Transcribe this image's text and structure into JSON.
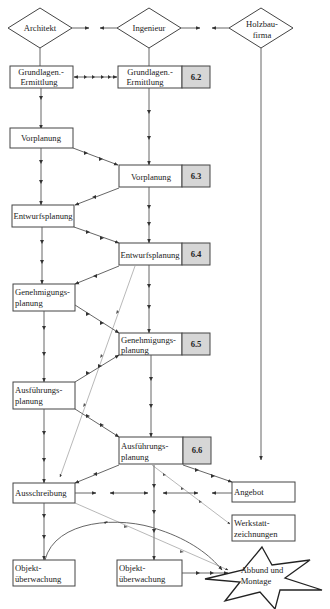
{
  "actors": {
    "architekt": "Architekt",
    "ingenieur": "Ingenieur",
    "holzbaufirma_line1": "Holzbau-",
    "holzbaufirma_line2": "firma"
  },
  "architect_column": {
    "grundlagen_line1": "Grundlagen.-",
    "grundlagen_line2": "Ermittlung",
    "vorplanung": "Vorplanung",
    "entwurfsplanung": "Entwurfsplanung",
    "genehmigung_line1": "Genehmigungs-",
    "genehmigung_line2": "planung",
    "ausfuehrung_line1": "Ausführungs-",
    "ausfuehrung_line2": "planung",
    "ausschreibung": "Ausschreibung",
    "objekt_line1": "Objekt-",
    "objekt_line2": "überwachung"
  },
  "engineer_column": {
    "grundlagen_line1": "Grundlagen.-",
    "grundlagen_line2": "Ermittlung",
    "grundlagen_badge": "6.2",
    "vorplanung": "Vorplanung",
    "vorplanung_badge": "6.3",
    "entwurfsplanung": "Entwurfsplanung",
    "entwurfsplanung_badge": "6.4",
    "genehmigung_line1": "Genehmigungs-",
    "genehmigung_line2": "planung",
    "genehmigung_badge": "6.5",
    "ausfuehrung_line1": "Ausführungs-",
    "ausfuehrung_line2": "planung",
    "ausfuehrung_badge": "6.6",
    "objekt_line1": "Objekt-",
    "objekt_line2": "überwachung"
  },
  "contractor_column": {
    "angebot": "Angebot",
    "werkstatt_line1": "Werkstatt-",
    "werkstatt_line2": "zeichnungen",
    "abbund_line1": "Abbund und",
    "abbund_line2": "Montage"
  },
  "colors": {
    "badge_fill": "#d6d6d6",
    "stroke": "#444444"
  }
}
